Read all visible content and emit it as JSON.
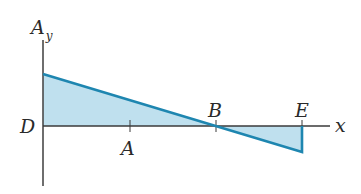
{
  "diagram": {
    "y_axis_label": "A",
    "y_axis_subscript": "y",
    "x_axis_label": "x",
    "points": {
      "D": "D",
      "A": "A",
      "B": "B",
      "E": "E"
    },
    "colors": {
      "line": "#1e86b0",
      "fill": "#bfe0ee",
      "axis": "#3a3a3a"
    }
  }
}
